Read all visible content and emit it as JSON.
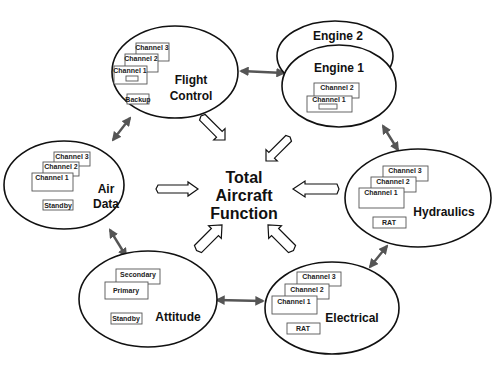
{
  "center": {
    "lines": [
      "Total",
      "Aircraft",
      "Function"
    ]
  },
  "systems": {
    "flight_control": {
      "label_lines": [
        "Flight",
        "Control"
      ],
      "channels": [
        "Channel 3",
        "Channel 2",
        "Channel 1"
      ],
      "backup": "Backup"
    },
    "engines": {
      "engine2_label": "Engine 2",
      "engine1_label": "Engine 1",
      "channels": [
        "Channel 2",
        "Channel 1"
      ]
    },
    "air_data": {
      "label_lines": [
        "Air",
        "Data"
      ],
      "channels": [
        "Channel 3",
        "Channel 2",
        "Channel 1"
      ],
      "backup": "Standby"
    },
    "hydraulics": {
      "label": "Hydraulics",
      "channels": [
        "Channel 3",
        "Channel 2",
        "Channel 1"
      ],
      "backup": "RAT"
    },
    "attitude": {
      "label": "Attitude",
      "channels": [
        "Secondary",
        "Primary"
      ],
      "backup": "Standby"
    },
    "electrical": {
      "label": "Electrical",
      "channels": [
        "Channel 3",
        "Channel 2",
        "Channel 1"
      ],
      "backup": "RAT"
    }
  },
  "colors": {
    "outline": "#111111",
    "link_arrow": "#555555",
    "box_border": "#555555",
    "background": "#ffffff"
  }
}
